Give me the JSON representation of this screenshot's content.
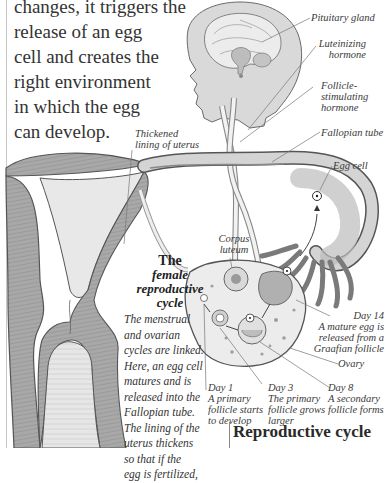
{
  "intro_text": {
    "lines": [
      "changes, it triggers the",
      "release of an egg",
      "cell and creates the",
      "right environment",
      "in which the egg",
      "can develop."
    ]
  },
  "labels": {
    "pituitary_gland": "Pituitary gland",
    "luteinizing_hormone": [
      "Luteinizing",
      "hormone"
    ],
    "follicle_stimulating_hormone": [
      "Follicle-",
      "stimulating",
      "hormone"
    ],
    "fallopian_tube": "Fallopian tube",
    "thickened_lining": [
      "Thickened",
      "lining of uterus"
    ],
    "egg_cell": "Egg cell",
    "corpus_luteum": [
      "Corpus",
      "luteum"
    ],
    "day14": [
      "Day 14",
      "A mature egg is",
      "released from a",
      "Graafian follicle"
    ],
    "ovary": "Ovary",
    "day1": [
      "Day 1",
      "A primary",
      "follicle starts",
      "to develop"
    ],
    "day3": [
      "Day 3",
      "The primary",
      "follicle grows",
      "larger"
    ],
    "day8": [
      "Day 8",
      "A secondary",
      "follicle forms"
    ]
  },
  "caption": {
    "title": [
      "The",
      "female",
      "reproductive",
      "cycle"
    ],
    "body": [
      "The menstrual",
      "and ovarian",
      "cycles are linked.",
      "Here, an egg cell",
      "matures and is",
      "released into the",
      "Fallopian tube.",
      "The lining of the",
      "uterus thickens",
      "so that if the",
      "egg is fertilized,"
    ]
  },
  "section_heading": "Reproductive cycle",
  "colors": {
    "tissue_gray": "#a9a9a9",
    "light_fill": "#e4e4e4",
    "outline": "#555555",
    "text": "#333333"
  }
}
